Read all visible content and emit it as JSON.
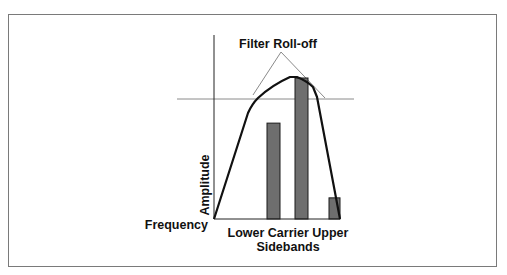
{
  "diagram": {
    "title": "Filter Roll-off",
    "axes": {
      "y_label": "Amplitude",
      "x_label": "Frequency"
    },
    "bar_labels": {
      "line1": "Lower Carrier Upper",
      "line2": "Sidebands"
    },
    "bars": [
      {
        "name": "lower-sideband",
        "relative_amplitude": 0.68
      },
      {
        "name": "carrier",
        "relative_amplitude": 1.0
      },
      {
        "name": "upper-sideband",
        "relative_amplitude": 0.15
      }
    ],
    "colors": {
      "bar_fill": "#6e6e6e",
      "bar_stroke": "#1a1a1a",
      "curve": "#111111",
      "guide_lines": "#8a8a8a",
      "axis": "#222222",
      "frame": "#7a7a7a"
    }
  }
}
